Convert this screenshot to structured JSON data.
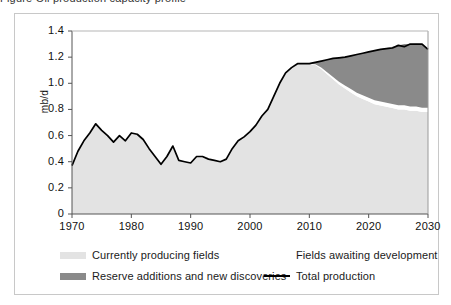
{
  "figure": {
    "title_fragment": "Figure   Oil production capacity profile",
    "ylabel": "mb/d"
  },
  "legend": {
    "items": [
      {
        "label": "Currently producing fields",
        "swatch": "light-gray-area",
        "color": "#e3e3e3",
        "kind": "area"
      },
      {
        "label": "Fields awaiting development",
        "swatch": "white-area",
        "color": "#ffffff",
        "kind": "area"
      },
      {
        "label": "Reserve additions and new discoveries",
        "swatch": "dark-gray-area",
        "color": "#8a8a8a",
        "kind": "area"
      },
      {
        "label": "Total production",
        "swatch": "black-line",
        "color": "#000000",
        "kind": "line"
      }
    ]
  },
  "chart_data": {
    "type": "area",
    "title": "Oil production capacity profile",
    "xlabel": "",
    "ylabel": "mb/d",
    "xlim": [
      1970,
      2030
    ],
    "ylim": [
      0,
      1.4
    ],
    "ytick_values": [
      0,
      0.2,
      0.4,
      0.6,
      0.8,
      1.0,
      1.2,
      1.4
    ],
    "ytick_labels": [
      "0",
      "0.2",
      "0.4",
      "0.6",
      "0.8",
      "1.0",
      "1.2",
      "1.4"
    ],
    "xtick_values": [
      1970,
      1980,
      1990,
      2000,
      2010,
      2020,
      2030
    ],
    "xtick_labels": [
      "1970",
      "1980",
      "1990",
      "2000",
      "2010",
      "2020",
      "2030"
    ],
    "grid": false,
    "legend_position": "below",
    "stacked": true,
    "x": [
      1970,
      1971,
      1972,
      1973,
      1974,
      1975,
      1976,
      1977,
      1978,
      1979,
      1980,
      1981,
      1982,
      1983,
      1984,
      1985,
      1986,
      1987,
      1988,
      1989,
      1990,
      1991,
      1992,
      1993,
      1994,
      1995,
      1996,
      1997,
      1998,
      1999,
      2000,
      2001,
      2002,
      2003,
      2004,
      2005,
      2006,
      2007,
      2008,
      2009,
      2010,
      2011,
      2012,
      2013,
      2014,
      2015,
      2016,
      2017,
      2018,
      2019,
      2020,
      2021,
      2022,
      2023,
      2024,
      2025,
      2026,
      2027,
      2028,
      2029,
      2030
    ],
    "series": [
      {
        "name": "Currently producing fields",
        "color": "#e3e3e3",
        "values": [
          0.37,
          0.48,
          0.56,
          0.62,
          0.69,
          0.64,
          0.6,
          0.55,
          0.6,
          0.56,
          0.62,
          0.61,
          0.57,
          0.5,
          0.44,
          0.38,
          0.44,
          0.52,
          0.41,
          0.4,
          0.39,
          0.44,
          0.44,
          0.42,
          0.41,
          0.4,
          0.42,
          0.5,
          0.56,
          0.59,
          0.63,
          0.68,
          0.75,
          0.8,
          0.9,
          1.0,
          1.08,
          1.12,
          1.15,
          1.15,
          1.15,
          1.14,
          1.11,
          1.07,
          1.03,
          0.99,
          0.96,
          0.93,
          0.9,
          0.88,
          0.86,
          0.84,
          0.83,
          0.82,
          0.81,
          0.8,
          0.8,
          0.79,
          0.79,
          0.78,
          0.78
        ]
      },
      {
        "name": "Fields awaiting development",
        "color": "#ffffff",
        "values": [
          0,
          0,
          0,
          0,
          0,
          0,
          0,
          0,
          0,
          0,
          0,
          0,
          0,
          0,
          0,
          0,
          0,
          0,
          0,
          0,
          0,
          0,
          0,
          0,
          0,
          0,
          0,
          0,
          0,
          0,
          0,
          0,
          0,
          0,
          0,
          0,
          0,
          0,
          0,
          0,
          0,
          0.005,
          0.01,
          0.014,
          0.018,
          0.021,
          0.024,
          0.026,
          0.028,
          0.029,
          0.03,
          0.031,
          0.031,
          0.032,
          0.032,
          0.032,
          0.032,
          0.032,
          0.032,
          0.032,
          0.032
        ]
      },
      {
        "name": "Reserve additions and new discoveries",
        "color": "#8a8a8a",
        "values": [
          0,
          0,
          0,
          0,
          0,
          0,
          0,
          0,
          0,
          0,
          0,
          0,
          0,
          0,
          0,
          0,
          0,
          0,
          0,
          0,
          0,
          0,
          0,
          0,
          0,
          0,
          0,
          0,
          0,
          0,
          0,
          0,
          0,
          0,
          0,
          0,
          0,
          0,
          0,
          0,
          0,
          0.015,
          0.05,
          0.096,
          0.142,
          0.184,
          0.216,
          0.254,
          0.292,
          0.321,
          0.35,
          0.379,
          0.399,
          0.418,
          0.438,
          0.458,
          0.468,
          0.478,
          0.481,
          0.488,
          0.45
        ]
      }
    ],
    "total_line": {
      "name": "Total production",
      "color": "#000000",
      "values": [
        0.37,
        0.48,
        0.56,
        0.62,
        0.69,
        0.64,
        0.6,
        0.55,
        0.6,
        0.56,
        0.62,
        0.61,
        0.57,
        0.5,
        0.44,
        0.38,
        0.44,
        0.52,
        0.41,
        0.4,
        0.39,
        0.44,
        0.44,
        0.42,
        0.41,
        0.4,
        0.42,
        0.5,
        0.56,
        0.59,
        0.63,
        0.68,
        0.75,
        0.8,
        0.9,
        1.0,
        1.08,
        1.12,
        1.15,
        1.15,
        1.15,
        1.16,
        1.17,
        1.18,
        1.19,
        1.195,
        1.2,
        1.21,
        1.22,
        1.23,
        1.24,
        1.25,
        1.26,
        1.265,
        1.27,
        1.29,
        1.28,
        1.3,
        1.3,
        1.3,
        1.26
      ]
    }
  }
}
